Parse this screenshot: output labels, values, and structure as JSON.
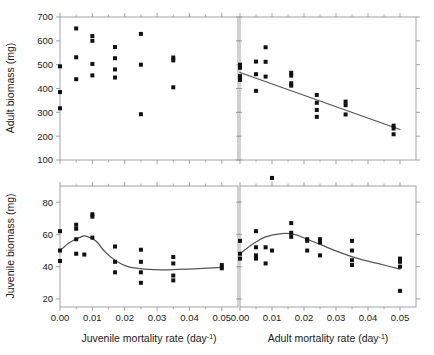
{
  "figure": {
    "type": "multi-panel-scatter",
    "panel_count": 4,
    "layout": "2x2",
    "marker_color": "#111111",
    "line_color": "#555555",
    "axis_color": "#999999"
  },
  "axis_titles": {
    "y_top": "Adult biomass (mg)",
    "y_bottom": "Juvenile biomass (mg)",
    "x_left": "Juvenile mortality rate (day",
    "x_left_sup": "-1",
    "x_left_tail": ")",
    "x_right": "Adult mortality rate (day",
    "x_right_sup": "-1",
    "x_right_tail": ")"
  },
  "chart_data": [
    {
      "id": "panel-top-left",
      "type": "scatter",
      "title": "",
      "xlabel": "Juvenile mortality rate (day-1)",
      "ylabel": "Adult biomass (mg)",
      "xlim": [
        0.0,
        0.055
      ],
      "ylim": [
        100,
        700
      ],
      "xticks": [
        0.0,
        0.01,
        0.02,
        0.03,
        0.04,
        0.05
      ],
      "xticklabels": [
        "0.00",
        "0.01",
        "0.02",
        "0.03",
        "0.04",
        "0.05"
      ],
      "yticks": [
        100,
        200,
        300,
        400,
        500,
        600,
        700
      ],
      "yticklabels": [
        "100",
        "200",
        "300",
        "400",
        "500",
        "600",
        "700"
      ],
      "grid": false,
      "legend": "none",
      "fit_line": null,
      "points": [
        {
          "x": 0.0,
          "y": 493
        },
        {
          "x": 0.0,
          "y": 385
        },
        {
          "x": 0.0,
          "y": 317
        },
        {
          "x": 0.005,
          "y": 652
        },
        {
          "x": 0.005,
          "y": 531
        },
        {
          "x": 0.005,
          "y": 439
        },
        {
          "x": 0.01,
          "y": 620
        },
        {
          "x": 0.01,
          "y": 600
        },
        {
          "x": 0.01,
          "y": 503
        },
        {
          "x": 0.01,
          "y": 455
        },
        {
          "x": 0.017,
          "y": 574
        },
        {
          "x": 0.017,
          "y": 527
        },
        {
          "x": 0.017,
          "y": 480
        },
        {
          "x": 0.017,
          "y": 446
        },
        {
          "x": 0.025,
          "y": 629
        },
        {
          "x": 0.025,
          "y": 500
        },
        {
          "x": 0.025,
          "y": 292
        },
        {
          "x": 0.035,
          "y": 530
        },
        {
          "x": 0.035,
          "y": 518
        },
        {
          "x": 0.035,
          "y": 405
        }
      ]
    },
    {
      "id": "panel-top-right",
      "type": "scatter",
      "title": "",
      "xlabel": "Adult mortality rate (day-1)",
      "ylabel": "Adult biomass (mg)",
      "xlim": [
        0.0,
        0.055
      ],
      "ylim": [
        100,
        700
      ],
      "xticks": [
        0.0,
        0.01,
        0.02,
        0.03,
        0.04,
        0.05
      ],
      "xticklabels": [
        "0.00",
        "0.01",
        "0.02",
        "0.03",
        "0.04",
        "0.05"
      ],
      "yticks": [
        100,
        200,
        300,
        400,
        500,
        600,
        700
      ],
      "yticklabels": [
        "100",
        "200",
        "300",
        "400",
        "500",
        "600",
        "700"
      ],
      "grid": false,
      "legend": "none",
      "fit_line": {
        "kind": "linear",
        "x_start": 0.0,
        "y_start": 467,
        "x_end": 0.05,
        "y_end": 228
      },
      "points": [
        {
          "x": 0.0,
          "y": 500
        },
        {
          "x": 0.0,
          "y": 487
        },
        {
          "x": 0.0,
          "y": 452
        },
        {
          "x": 0.0,
          "y": 436
        },
        {
          "x": 0.005,
          "y": 513
        },
        {
          "x": 0.005,
          "y": 460
        },
        {
          "x": 0.005,
          "y": 390
        },
        {
          "x": 0.008,
          "y": 573
        },
        {
          "x": 0.008,
          "y": 512
        },
        {
          "x": 0.008,
          "y": 450
        },
        {
          "x": 0.016,
          "y": 466
        },
        {
          "x": 0.016,
          "y": 454
        },
        {
          "x": 0.016,
          "y": 422
        },
        {
          "x": 0.016,
          "y": 412
        },
        {
          "x": 0.024,
          "y": 373
        },
        {
          "x": 0.024,
          "y": 340
        },
        {
          "x": 0.024,
          "y": 310
        },
        {
          "x": 0.024,
          "y": 281
        },
        {
          "x": 0.033,
          "y": 345
        },
        {
          "x": 0.033,
          "y": 330
        },
        {
          "x": 0.033,
          "y": 291
        },
        {
          "x": 0.048,
          "y": 244
        },
        {
          "x": 0.048,
          "y": 232
        },
        {
          "x": 0.048,
          "y": 208
        }
      ]
    },
    {
      "id": "panel-bottom-left",
      "type": "scatter",
      "title": "",
      "xlabel": "Juvenile mortality rate (day-1)",
      "ylabel": "Juvenile biomass (mg)",
      "xlim": [
        0.0,
        0.055
      ],
      "ylim": [
        15,
        90
      ],
      "xticks": [
        0.0,
        0.01,
        0.02,
        0.03,
        0.04,
        0.05
      ],
      "xticklabels": [
        "0.00",
        "0.01",
        "0.02",
        "0.03",
        "0.04",
        "0.05"
      ],
      "yticks": [
        20,
        40,
        60,
        80
      ],
      "yticklabels": [
        "20",
        "40",
        "60",
        "80"
      ],
      "grid": false,
      "legend": "none",
      "fit_line": {
        "kind": "smooth-hump-decay",
        "points": [
          {
            "x": 0.0,
            "y": 50
          },
          {
            "x": 0.003,
            "y": 55
          },
          {
            "x": 0.006,
            "y": 58
          },
          {
            "x": 0.008,
            "y": 59
          },
          {
            "x": 0.011,
            "y": 56
          },
          {
            "x": 0.014,
            "y": 49
          },
          {
            "x": 0.017,
            "y": 44
          },
          {
            "x": 0.021,
            "y": 40
          },
          {
            "x": 0.026,
            "y": 38.5
          },
          {
            "x": 0.032,
            "y": 38
          },
          {
            "x": 0.04,
            "y": 38.5
          },
          {
            "x": 0.05,
            "y": 39.5
          }
        ]
      },
      "points": [
        {
          "x": 0.0,
          "y": 62
        },
        {
          "x": 0.0,
          "y": 50
        },
        {
          "x": 0.0,
          "y": 43.5
        },
        {
          "x": 0.005,
          "y": 66
        },
        {
          "x": 0.005,
          "y": 63.5
        },
        {
          "x": 0.005,
          "y": 57
        },
        {
          "x": 0.005,
          "y": 48
        },
        {
          "x": 0.0075,
          "y": 47.5
        },
        {
          "x": 0.01,
          "y": 72.5
        },
        {
          "x": 0.01,
          "y": 71
        },
        {
          "x": 0.01,
          "y": 58
        },
        {
          "x": 0.017,
          "y": 52.5
        },
        {
          "x": 0.017,
          "y": 43
        },
        {
          "x": 0.017,
          "y": 36.5
        },
        {
          "x": 0.025,
          "y": 50.5
        },
        {
          "x": 0.025,
          "y": 43
        },
        {
          "x": 0.025,
          "y": 36.5
        },
        {
          "x": 0.025,
          "y": 30
        },
        {
          "x": 0.035,
          "y": 46
        },
        {
          "x": 0.035,
          "y": 42
        },
        {
          "x": 0.035,
          "y": 34.5
        },
        {
          "x": 0.035,
          "y": 31.5
        },
        {
          "x": 0.05,
          "y": 41
        },
        {
          "x": 0.05,
          "y": 39
        }
      ]
    },
    {
      "id": "panel-bottom-right",
      "type": "scatter",
      "title": "",
      "xlabel": "Adult mortality rate (day-1)",
      "ylabel": "Juvenile biomass (mg)",
      "xlim": [
        0.0,
        0.055
      ],
      "ylim": [
        15,
        90
      ],
      "xticks": [
        0.0,
        0.01,
        0.02,
        0.03,
        0.04,
        0.05
      ],
      "xticklabels": [
        "0.00",
        "0.01",
        "0.02",
        "0.03",
        "0.04",
        "0.05"
      ],
      "yticks": [
        20,
        40,
        60,
        80
      ],
      "yticklabels": [
        "20",
        "40",
        "60",
        "80"
      ],
      "grid": false,
      "legend": "none",
      "fit_line": {
        "kind": "smooth-hump",
        "points": [
          {
            "x": 0.0,
            "y": 48
          },
          {
            "x": 0.004,
            "y": 54
          },
          {
            "x": 0.008,
            "y": 58.5
          },
          {
            "x": 0.013,
            "y": 60.5
          },
          {
            "x": 0.017,
            "y": 60
          },
          {
            "x": 0.021,
            "y": 57
          },
          {
            "x": 0.026,
            "y": 53
          },
          {
            "x": 0.031,
            "y": 49
          },
          {
            "x": 0.037,
            "y": 45
          },
          {
            "x": 0.043,
            "y": 42
          },
          {
            "x": 0.05,
            "y": 38.5
          }
        ]
      },
      "points": [
        {
          "x": 0.0,
          "y": 56
        },
        {
          "x": 0.0,
          "y": 48
        },
        {
          "x": 0.0,
          "y": 45
        },
        {
          "x": 0.005,
          "y": 62
        },
        {
          "x": 0.005,
          "y": 52
        },
        {
          "x": 0.005,
          "y": 47
        },
        {
          "x": 0.005,
          "y": 45
        },
        {
          "x": 0.008,
          "y": 52
        },
        {
          "x": 0.008,
          "y": 42
        },
        {
          "x": 0.01,
          "y": 95
        },
        {
          "x": 0.01,
          "y": 50
        },
        {
          "x": 0.016,
          "y": 67
        },
        {
          "x": 0.016,
          "y": 61
        },
        {
          "x": 0.016,
          "y": 58.5
        },
        {
          "x": 0.021,
          "y": 57
        },
        {
          "x": 0.021,
          "y": 56
        },
        {
          "x": 0.021,
          "y": 50
        },
        {
          "x": 0.025,
          "y": 57
        },
        {
          "x": 0.025,
          "y": 55
        },
        {
          "x": 0.025,
          "y": 47
        },
        {
          "x": 0.035,
          "y": 56
        },
        {
          "x": 0.035,
          "y": 50
        },
        {
          "x": 0.035,
          "y": 44
        },
        {
          "x": 0.035,
          "y": 41
        },
        {
          "x": 0.05,
          "y": 45
        },
        {
          "x": 0.05,
          "y": 43
        },
        {
          "x": 0.05,
          "y": 40
        },
        {
          "x": 0.05,
          "y": 25
        }
      ]
    }
  ]
}
